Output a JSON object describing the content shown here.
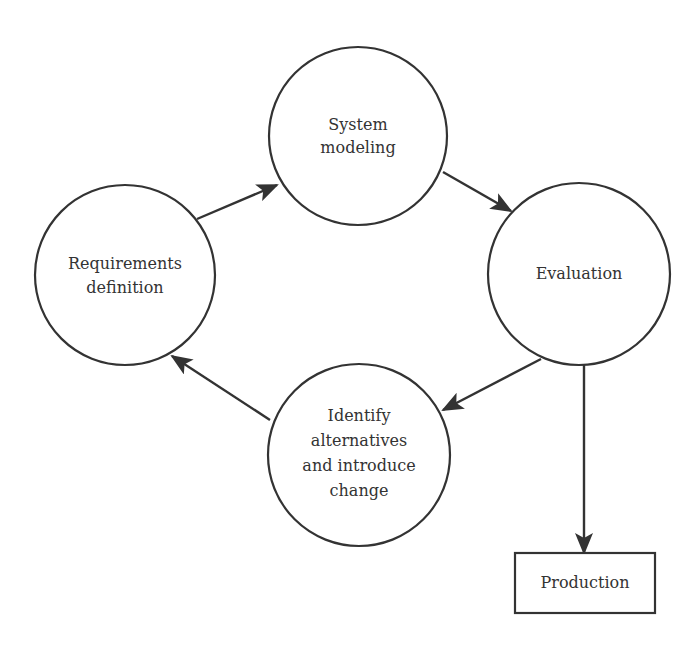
{
  "diagram": {
    "type": "cycle-flow",
    "nodes": {
      "system_modeling": {
        "lines": [
          "System",
          "modeling"
        ],
        "shape": "circle"
      },
      "evaluation": {
        "lines": [
          "Evaluation"
        ],
        "shape": "circle"
      },
      "identify": {
        "lines": [
          "Identify",
          "alternatives",
          "and introduce",
          "change"
        ],
        "shape": "circle"
      },
      "requirements": {
        "lines": [
          "Requirements",
          "definition"
        ],
        "shape": "circle"
      },
      "production": {
        "lines": [
          "Production"
        ],
        "shape": "rectangle"
      }
    },
    "edges": [
      {
        "from": "requirements",
        "to": "system_modeling"
      },
      {
        "from": "system_modeling",
        "to": "evaluation"
      },
      {
        "from": "evaluation",
        "to": "identify"
      },
      {
        "from": "identify",
        "to": "requirements"
      },
      {
        "from": "evaluation",
        "to": "production"
      }
    ],
    "colors": {
      "stroke": "#333333",
      "background": "#ffffff",
      "text": "#333333"
    }
  }
}
